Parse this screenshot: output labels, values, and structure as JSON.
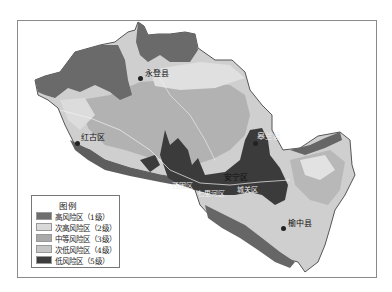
{
  "legend": {
    "title": "图例",
    "items": [
      {
        "label": "高风险区（1级）",
        "color": "#6e6e6e"
      },
      {
        "label": "次高风险区（2级）",
        "color": "#d9d9d9"
      },
      {
        "label": "中等风险区（3级）",
        "color": "#a9a9a9"
      },
      {
        "label": "次低风险区（4级）",
        "color": "#c6c6c6"
      },
      {
        "label": "低风险区（5级）",
        "color": "#3d3d3d"
      }
    ]
  },
  "places": [
    {
      "name": "永登县",
      "x": 145,
      "y": 70
    },
    {
      "name": "红古区",
      "x": 81,
      "y": 134
    },
    {
      "name": "皋兰县",
      "x": 252,
      "y": 133
    },
    {
      "name": "安宁区",
      "x": 224,
      "y": 174
    },
    {
      "name": "西固区",
      "x": 176,
      "y": 183
    },
    {
      "name": "七里河区",
      "x": 199,
      "y": 192
    },
    {
      "name": "城关区",
      "x": 240,
      "y": 187
    },
    {
      "name": "榆中县",
      "x": 288,
      "y": 222
    }
  ]
}
